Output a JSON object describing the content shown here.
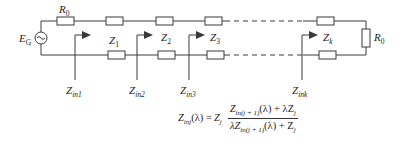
{
  "diagram": {
    "type": "circuit-ladder-network",
    "source_label": "E",
    "source_sub": "G",
    "source_resistor_label": "R",
    "source_resistor_sub": "0",
    "load_resistor_label": "R",
    "load_resistor_sub": "0",
    "sections": [
      {
        "z_label": "Z",
        "z_sub": "1",
        "zin_label": "Z",
        "zin_sub": "in1"
      },
      {
        "z_label": "Z",
        "z_sub": "2",
        "zin_label": "Z",
        "zin_sub": "in2"
      },
      {
        "z_label": "Z",
        "z_sub": "3",
        "zin_label": "Z",
        "zin_sub": "in3"
      },
      {
        "z_label": "Z",
        "z_sub": "k",
        "zin_label": "Z",
        "zin_sub": "ink"
      }
    ],
    "source_symbol": "ac-source-icon",
    "formula": {
      "lhs": "Z",
      "lhs_sub": "inj",
      "lhs_arg": "(λ) = ",
      "factor": "Z",
      "factor_sub": "j",
      "num_a": "Z",
      "num_a_sub": "in(j + 1)",
      "num_b": "(λ) + λZ",
      "num_b_sub": "j",
      "den_a": "λZ",
      "den_a_sub": "in(j + 1)",
      "den_b": "(λ) + Z",
      "den_b_sub": "j"
    }
  }
}
